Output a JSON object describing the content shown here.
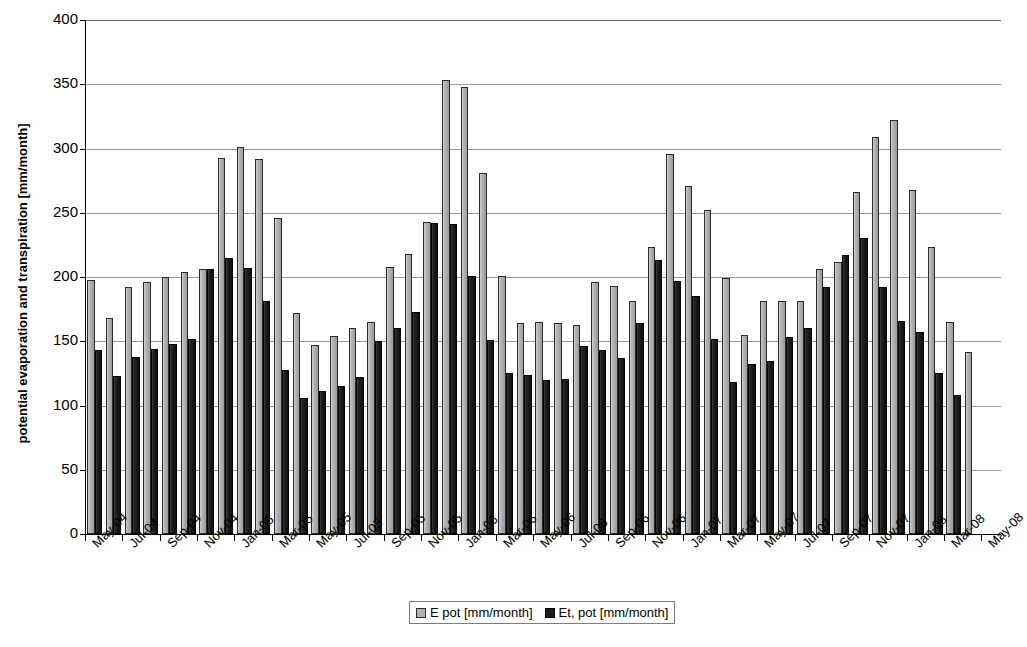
{
  "chart_data": {
    "type": "bar",
    "title": "",
    "xlabel": "",
    "ylabel": "potential evaporation and transpiration [mm/month]",
    "ylim": [
      0,
      400
    ],
    "ytick_step": 50,
    "yticks": [
      0,
      50,
      100,
      150,
      200,
      250,
      300,
      350,
      400
    ],
    "grid": true,
    "legend_position": "bottom-center",
    "x_tick_interval_months": 2,
    "categories": [
      "May-04",
      "Jun-04",
      "Jul-04",
      "Aug-04",
      "Sep-04",
      "Oct-04",
      "Nov-04",
      "Dec-04",
      "Jan-05",
      "Feb-05",
      "Mar-05",
      "Apr-05",
      "May-05",
      "Jun-05",
      "Jul-05",
      "Aug-05",
      "Sep-05",
      "Oct-05",
      "Nov-05",
      "Dec-05",
      "Jan-06",
      "Feb-06",
      "Mar-06",
      "Apr-06",
      "May-06",
      "Jun-06",
      "Jul-06",
      "Aug-06",
      "Sep-06",
      "Oct-06",
      "Nov-06",
      "Dec-06",
      "Jan-07",
      "Feb-07",
      "Mar-07",
      "Apr-07",
      "May-07",
      "Jun-07",
      "Jul-07",
      "Aug-07",
      "Sep-07",
      "Oct-07",
      "Nov-07",
      "Dec-07",
      "Jan-08",
      "Feb-08",
      "Mar-08",
      "Apr-08",
      "May-08"
    ],
    "tick_labels": [
      "May-04",
      "Jul-04",
      "Sep-04",
      "Nov-04",
      "Jan-05",
      "Mar-05",
      "May-05",
      "Jul-05",
      "Sep-05",
      "Nov-05",
      "Jan-06",
      "Mar-06",
      "May-06",
      "Jul-06",
      "Sep-06",
      "Nov-06",
      "Jan-07",
      "Mar-07",
      "May-07",
      "Jul-07",
      "Sep-07",
      "Nov-07",
      "Jan-08",
      "Mar-08",
      "May-08"
    ],
    "series": [
      {
        "name": "E pot [mm/month]",
        "color": "#b0b0b0",
        "values": [
          198,
          168,
          192,
          196,
          200,
          204,
          206,
          293,
          301,
          292,
          246,
          172,
          147,
          154,
          160,
          165,
          208,
          218,
          243,
          353,
          348,
          281,
          201,
          164,
          165,
          164,
          163,
          196,
          193,
          181,
          223,
          296,
          271,
          252,
          199,
          155,
          181,
          181,
          181,
          206,
          212,
          266,
          309,
          322,
          268,
          223,
          165,
          142,
          0
        ]
      },
      {
        "name": "Et, pot [mm/month]",
        "color": "#1b1b1b",
        "values": [
          143,
          123,
          138,
          144,
          148,
          152,
          206,
          215,
          207,
          181,
          128,
          106,
          111,
          115,
          122,
          150,
          160,
          173,
          242,
          241,
          201,
          151,
          125,
          124,
          120,
          121,
          146,
          143,
          137,
          164,
          213,
          197,
          185,
          152,
          118,
          132,
          135,
          153,
          160,
          192,
          217,
          230,
          192,
          166,
          157,
          125,
          108,
          0,
          0
        ]
      }
    ]
  },
  "legend": {
    "items": [
      {
        "label": "E pot [mm/month]",
        "swatch": "light-gray"
      },
      {
        "label": "Et, pot [mm/month]",
        "swatch": "dark"
      }
    ]
  },
  "axis": {
    "y_title": "potential evaporation and transpiration [mm/month]"
  }
}
